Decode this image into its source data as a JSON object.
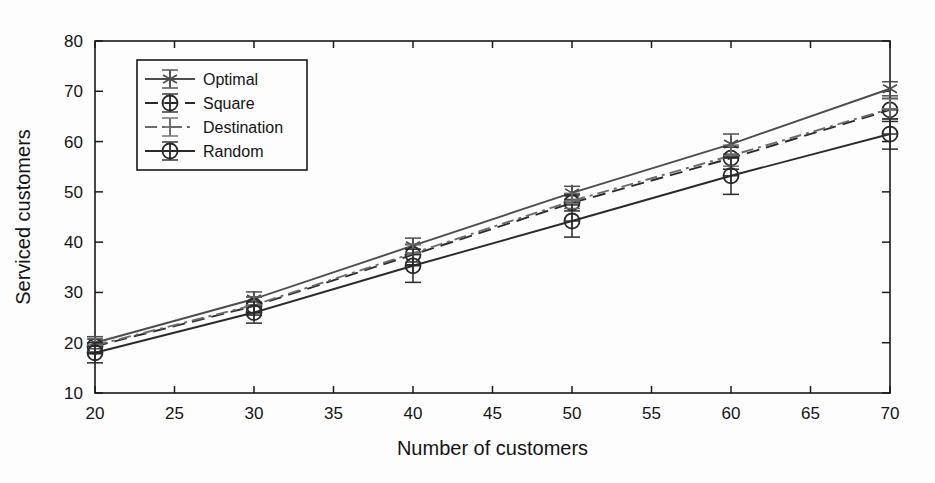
{
  "chart_data": {
    "type": "line",
    "title": "",
    "xlabel": "Number of customers",
    "ylabel": "Serviced customers",
    "x": [
      20,
      30,
      40,
      50,
      60,
      70
    ],
    "xlim": [
      20,
      70
    ],
    "ylim": [
      10,
      80
    ],
    "xticks": [
      20,
      25,
      30,
      35,
      40,
      45,
      50,
      55,
      60,
      65,
      70
    ],
    "yticks": [
      10,
      20,
      30,
      40,
      50,
      60,
      70,
      80
    ],
    "grid": false,
    "legend_position": "upper left",
    "error_bars": true,
    "series": [
      {
        "name": "Optimal",
        "marker": "star",
        "linestyle": "solid",
        "color": "#4d4d4d",
        "values": [
          20.0,
          28.7,
          39.3,
          49.8,
          59.5,
          70.5
        ],
        "errors": [
          1.2,
          1.4,
          1.5,
          1.3,
          2.0,
          1.4
        ]
      },
      {
        "name": "Square",
        "marker": "circle",
        "linestyle": "dashed",
        "color": "#2a2a2a",
        "values": [
          19.3,
          27.3,
          37.5,
          47.8,
          56.7,
          66.3
        ],
        "errors": [
          1.5,
          1.8,
          2.0,
          1.6,
          2.2,
          2.3
        ]
      },
      {
        "name": "Destination",
        "marker": "plus",
        "linestyle": "dashdot",
        "color": "#6b6b6b",
        "values": [
          19.5,
          27.5,
          37.8,
          48.2,
          57.2,
          66.5
        ],
        "errors": [
          1.3,
          1.6,
          1.8,
          1.5,
          2.1,
          2.0
        ]
      },
      {
        "name": "Random",
        "marker": "circle",
        "linestyle": "solid",
        "color": "#2a2a2a",
        "values": [
          18.0,
          26.0,
          35.3,
          44.2,
          53.2,
          61.5
        ],
        "errors": [
          2.0,
          2.1,
          3.3,
          3.2,
          3.7,
          3.0
        ]
      }
    ]
  },
  "legend": {
    "entries": [
      {
        "label": "Optimal"
      },
      {
        "label": "Square"
      },
      {
        "label": "Destination"
      },
      {
        "label": "Random"
      }
    ]
  },
  "axes": {
    "x_label": "Number of customers",
    "y_label": "Serviced customers",
    "x_ticks": [
      "20",
      "25",
      "30",
      "35",
      "40",
      "45",
      "50",
      "55",
      "60",
      "65",
      "70"
    ],
    "y_ticks": [
      "10",
      "20",
      "30",
      "40",
      "50",
      "60",
      "70",
      "80"
    ]
  },
  "colors": {
    "axis": "#1a1a1a",
    "background": "#fdfdfd",
    "optimal": "#4d4d4d",
    "square": "#2a2a2a",
    "destination": "#6b6b6b",
    "random": "#2a2a2a"
  }
}
